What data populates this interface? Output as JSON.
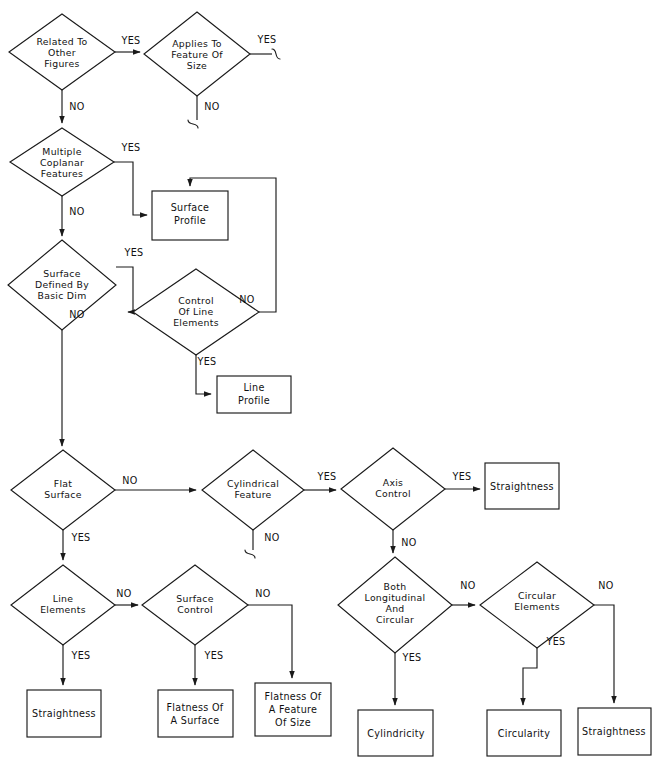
{
  "diagram": {
    "line_color": "#1a1a1a",
    "background": "#ffffff",
    "yes_label": "YES",
    "no_label": "NO"
  },
  "decisions": [
    {
      "id": "related-to-other-figures",
      "lines": [
        "Related  To",
        "Other",
        "Figures"
      ],
      "cx": 62,
      "cy": 52,
      "rx": 53,
      "ry": 38
    },
    {
      "id": "applies-to-feature-of-size",
      "lines": [
        "Applies  To",
        "Feature  Of",
        "Size"
      ],
      "cx": 197,
      "cy": 54,
      "rx": 53,
      "ry": 42
    },
    {
      "id": "multiple-coplanar-features",
      "lines": [
        "Multiple",
        "Coplanar",
        "Features"
      ],
      "cx": 62,
      "cy": 162,
      "rx": 52,
      "ry": 34
    },
    {
      "id": "surface-defined-by-basic-dim",
      "lines": [
        "Surface",
        "Defined  By",
        "Basic  Dim"
      ],
      "cx": 62,
      "cy": 285,
      "rx": 54,
      "ry": 45
    },
    {
      "id": "control-of-line-elements",
      "lines": [
        "Control",
        "Of  Line",
        "Elements"
      ],
      "cx": 196,
      "cy": 312,
      "rx": 63,
      "ry": 43
    },
    {
      "id": "flat-surface",
      "lines": [
        "Flat",
        "Surface"
      ],
      "cx": 63,
      "cy": 490,
      "rx": 52,
      "ry": 40
    },
    {
      "id": "cylindrical-feature",
      "lines": [
        "Cylindrical",
        "Feature"
      ],
      "cx": 253,
      "cy": 490,
      "rx": 51,
      "ry": 40
    },
    {
      "id": "axis-control",
      "lines": [
        "Axis",
        "Control"
      ],
      "cx": 393,
      "cy": 489,
      "rx": 52,
      "ry": 41
    },
    {
      "id": "line-elements",
      "lines": [
        "Line",
        "Elements"
      ],
      "cx": 63,
      "cy": 605,
      "rx": 52,
      "ry": 40
    },
    {
      "id": "surface-control",
      "lines": [
        "Surface",
        "Control"
      ],
      "cx": 195,
      "cy": 605,
      "rx": 53,
      "ry": 40
    },
    {
      "id": "both-longitudinal-and-circular",
      "lines": [
        "Both",
        "Longitudinal",
        "And",
        "Circular"
      ],
      "cx": 395,
      "cy": 605,
      "rx": 57,
      "ry": 48
    },
    {
      "id": "circular-elements",
      "lines": [
        "Circular",
        "Elements"
      ],
      "cx": 537,
      "cy": 605,
      "rx": 57,
      "ry": 43
    }
  ],
  "terminals": [
    {
      "id": "surface-profile",
      "lines": [
        "Surface",
        "Profile"
      ],
      "x": 152,
      "y": 191,
      "w": 76,
      "h": 49
    },
    {
      "id": "line-profile",
      "lines": [
        "Line",
        "Profile"
      ],
      "x": 217,
      "y": 376,
      "w": 74,
      "h": 37
    },
    {
      "id": "straightness-axis",
      "lines": [
        "Straightness"
      ],
      "x": 485,
      "y": 463,
      "w": 74,
      "h": 46
    },
    {
      "id": "straightness-line-elements",
      "lines": [
        "Straightness"
      ],
      "x": 27,
      "y": 690,
      "w": 74,
      "h": 47
    },
    {
      "id": "flatness-of-a-surface",
      "lines": [
        "Flatness  Of",
        "A  Surface"
      ],
      "x": 158,
      "y": 690,
      "w": 75,
      "h": 47
    },
    {
      "id": "flatness-of-a-feature-of-size",
      "lines": [
        "Flatness  Of",
        "A  Feature",
        "Of  Size"
      ],
      "x": 255,
      "y": 683,
      "w": 76,
      "h": 53
    },
    {
      "id": "cylindricity",
      "lines": [
        "Cylindricity"
      ],
      "x": 358,
      "y": 710,
      "w": 75,
      "h": 46
    },
    {
      "id": "circularity",
      "lines": [
        "Circularity"
      ],
      "x": 487,
      "y": 710,
      "w": 74,
      "h": 46
    },
    {
      "id": "straightness-circular",
      "lines": [
        "Straightness"
      ],
      "x": 578,
      "y": 708,
      "w": 73,
      "h": 47
    }
  ],
  "edge_labels": [
    {
      "id": "related-yes",
      "text": "YES",
      "x": 131,
      "y": 44
    },
    {
      "id": "related-no",
      "text": "NO",
      "x": 77,
      "y": 110
    },
    {
      "id": "applies-yes",
      "text": "YES",
      "x": 267,
      "y": 43
    },
    {
      "id": "applies-no",
      "text": "NO",
      "x": 212,
      "y": 110
    },
    {
      "id": "coplanar-yes",
      "text": "YES",
      "x": 131,
      "y": 151
    },
    {
      "id": "coplanar-no",
      "text": "NO",
      "x": 77,
      "y": 215
    },
    {
      "id": "basic-dim-yes",
      "text": "YES",
      "x": 134,
      "y": 256
    },
    {
      "id": "basic-dim-no",
      "text": "NO",
      "x": 77,
      "y": 318
    },
    {
      "id": "control-line-no",
      "text": "NO",
      "x": 247,
      "y": 303
    },
    {
      "id": "control-line-yes",
      "text": "YES",
      "x": 207,
      "y": 365
    },
    {
      "id": "flat-surface-no",
      "text": "NO",
      "x": 130,
      "y": 484
    },
    {
      "id": "flat-surface-yes",
      "text": "YES",
      "x": 81,
      "y": 541
    },
    {
      "id": "cylindrical-yes",
      "text": "YES",
      "x": 327,
      "y": 480
    },
    {
      "id": "cylindrical-no",
      "text": "NO",
      "x": 272,
      "y": 541
    },
    {
      "id": "axis-control-yes",
      "text": "YES",
      "x": 462,
      "y": 480
    },
    {
      "id": "axis-control-no",
      "text": "NO",
      "x": 409,
      "y": 546
    },
    {
      "id": "line-elements-no",
      "text": "NO",
      "x": 124,
      "y": 597
    },
    {
      "id": "line-elements-yes",
      "text": "YES",
      "x": 81,
      "y": 659
    },
    {
      "id": "surface-control-no",
      "text": "NO",
      "x": 263,
      "y": 597
    },
    {
      "id": "surface-control-yes",
      "text": "YES",
      "x": 214,
      "y": 659
    },
    {
      "id": "both-long-circ-no",
      "text": "NO",
      "x": 468,
      "y": 589
    },
    {
      "id": "both-long-circ-yes",
      "text": "YES",
      "x": 412,
      "y": 661
    },
    {
      "id": "circular-elements-no",
      "text": "NO",
      "x": 606,
      "y": 589
    },
    {
      "id": "circular-elements-yes",
      "text": "YES",
      "x": 556,
      "y": 645
    }
  ]
}
